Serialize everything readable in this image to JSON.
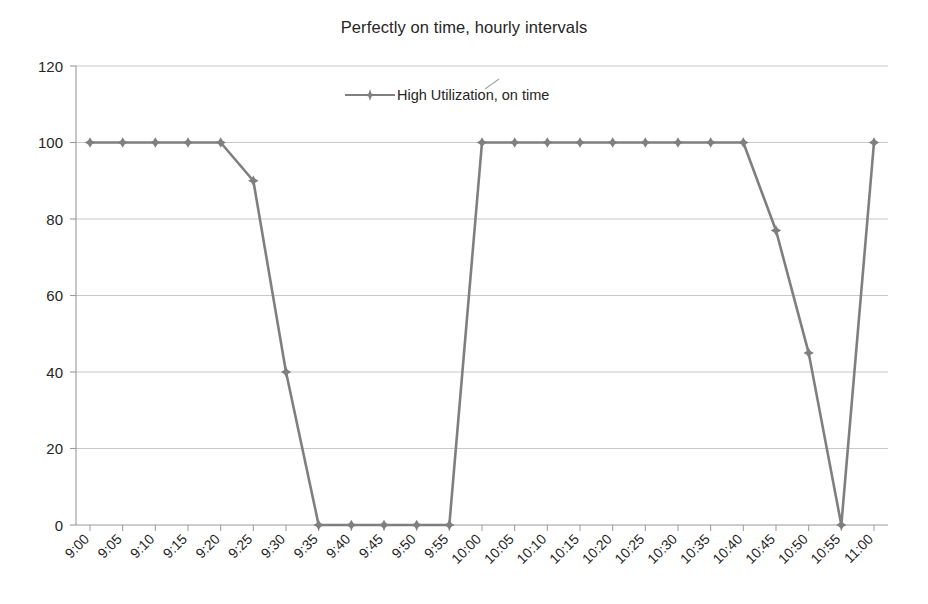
{
  "chart_data": {
    "type": "line",
    "title": "Perfectly on time, hourly intervals",
    "xlabel": "",
    "ylabel": "",
    "ylim": [
      0,
      120
    ],
    "yticks": [
      0,
      20,
      40,
      60,
      80,
      100,
      120
    ],
    "grid": true,
    "legend_position": "top-center",
    "categories": [
      "9:00",
      "9:05",
      "9:10",
      "9:15",
      "9:20",
      "9:25",
      "9:30",
      "9:35",
      "9:40",
      "9:45",
      "9:50",
      "9:55",
      "10:00",
      "10:05",
      "10:10",
      "10:15",
      "10:20",
      "10:25",
      "10:30",
      "10:35",
      "10:40",
      "10:45",
      "10:50",
      "10:55",
      "11:00"
    ],
    "series": [
      {
        "name": "High Utilization, on time",
        "color": "#7f7f7f",
        "marker": "diamond",
        "values": [
          100,
          100,
          100,
          100,
          100,
          90,
          40,
          0,
          0,
          0,
          0,
          0,
          100,
          100,
          100,
          100,
          100,
          100,
          100,
          100,
          100,
          77,
          45,
          0,
          100
        ]
      }
    ]
  },
  "legend": {
    "entries": [
      {
        "label": "High Utilization, on time"
      }
    ]
  },
  "axes": {
    "y_tick_labels": [
      "0",
      "20",
      "40",
      "60",
      "80",
      "100",
      "120"
    ],
    "x_tick_labels": [
      "9:00",
      "9:05",
      "9:10",
      "9:15",
      "9:20",
      "9:25",
      "9:30",
      "9:35",
      "9:40",
      "9:45",
      "9:50",
      "9:55",
      "10:00",
      "10:05",
      "10:10",
      "10:15",
      "10:20",
      "10:25",
      "10:30",
      "10:35",
      "10:40",
      "10:45",
      "10:50",
      "10:55",
      "11:00"
    ]
  },
  "colors": {
    "series_line": "#7f7f7f",
    "gridline": "#c8c8c8",
    "axis": "#9a9a9a",
    "text": "#262626"
  }
}
